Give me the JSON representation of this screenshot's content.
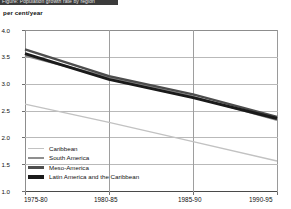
{
  "banner": {
    "text": "Figure: Population growth rate by region"
  },
  "chart_data": {
    "type": "line",
    "title": "",
    "subtitle": "",
    "xlabel": "",
    "ylabel": "per cent/year",
    "unit_label": "per cent/year",
    "categories": [
      "1975-80",
      "1980-85",
      "1985-90",
      "1990-95"
    ],
    "x_tick_labels": [
      "1975-80",
      "1980-85",
      "1985-90",
      "1990-95"
    ],
    "y_tick_labels": [
      "4.0",
      "3.5",
      "3.0",
      "2.5",
      "2.0",
      "1.5",
      "1.0"
    ],
    "y_tick_values": [
      4.0,
      3.5,
      3.0,
      2.5,
      2.0,
      1.5,
      1.0
    ],
    "ylim": [
      1.0,
      4.0
    ],
    "grid": "both",
    "legend_position": "bottom-left",
    "series": [
      {
        "name": "Caribbean",
        "color": "#c2c2c2",
        "width": 1.4,
        "values": [
          2.62,
          2.28,
          1.92,
          1.56
        ]
      },
      {
        "name": "South America",
        "color": "#8f8f8f",
        "width": 1.9,
        "values": [
          3.52,
          3.12,
          2.76,
          2.32
        ]
      },
      {
        "name": "Meso-America",
        "color": "#4d4d4d",
        "width": 2.4,
        "values": [
          3.64,
          3.14,
          2.8,
          2.38
        ]
      },
      {
        "name": "Latin America and the Caribbean",
        "color": "#1a1a1a",
        "width": 3.0,
        "values": [
          3.56,
          3.08,
          2.74,
          2.35
        ]
      }
    ],
    "legend": [
      "Caribbean",
      "South America",
      "Meso-America",
      "Latin America and the Caribbean"
    ]
  },
  "colors": {
    "background": "#ffffff",
    "axis": "#8d8d8d",
    "grid": "#b9b9b9",
    "banner": "#3b3b3b",
    "text": "#111111"
  }
}
